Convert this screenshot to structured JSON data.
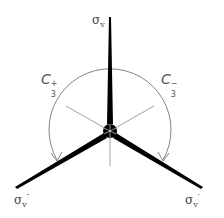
{
  "diagram": {
    "center": [
      110,
      131
    ],
    "arc_radius": 61,
    "colors": {
      "plane": "#000000",
      "axis": "#777777",
      "arc": "#777777",
      "text": "#444444"
    },
    "labels": {
      "sigma_v": {
        "base": "σ",
        "sub": "v",
        "mark": ""
      },
      "sigma_v1": {
        "base": "σ",
        "sub": "v",
        "mark": "′"
      },
      "sigma_v2": {
        "base": "σ",
        "sub": "v",
        "mark": "″"
      },
      "c3_plus": {
        "base": "C",
        "sub": "3",
        "sup": "+"
      },
      "c3_minus": {
        "base": "C",
        "sub": "3",
        "sup": "−"
      }
    }
  }
}
